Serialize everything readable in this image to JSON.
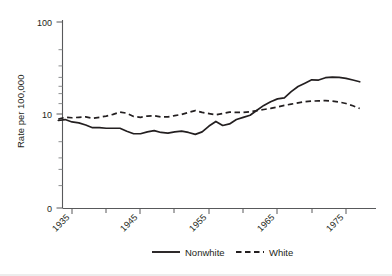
{
  "chart_data": {
    "type": "line",
    "title": "",
    "xlabel": "",
    "ylabel": "Rate per 100,000",
    "yscale": "log",
    "ylim": [
      3,
      100
    ],
    "xlim": [
      1933,
      1978
    ],
    "grid": false,
    "legend_position": "bottom-center",
    "y_tick_labels": [
      "100",
      "10",
      "0"
    ],
    "y_tick_values": [
      100,
      10,
      0
    ],
    "x_tick_labels": [
      "1935",
      "1945",
      "1955",
      "1965",
      "1975"
    ],
    "x_tick_values": [
      1935,
      1945,
      1955,
      1965,
      1975
    ],
    "x_minor_tick_values": [
      1940,
      1950,
      1960,
      1970
    ],
    "series": [
      {
        "name": "Nonwhite",
        "style": "solid",
        "color": "#231f20",
        "x": [
          1933,
          1934,
          1935,
          1936,
          1937,
          1938,
          1939,
          1940,
          1941,
          1942,
          1943,
          1944,
          1945,
          1946,
          1947,
          1948,
          1949,
          1950,
          1951,
          1952,
          1953,
          1954,
          1955,
          1956,
          1957,
          1958,
          1959,
          1960,
          1961,
          1962,
          1963,
          1964,
          1965,
          1966,
          1967,
          1968,
          1969,
          1970,
          1971,
          1972,
          1973,
          1974,
          1975,
          1976,
          1977
        ],
        "values": [
          8.5,
          8.7,
          8.2,
          8.0,
          7.6,
          7.1,
          7.1,
          7.0,
          7.0,
          7.0,
          6.5,
          6.1,
          6.1,
          6.4,
          6.6,
          6.3,
          6.2,
          6.4,
          6.5,
          6.3,
          6.0,
          6.4,
          7.4,
          8.3,
          7.5,
          7.8,
          8.7,
          9.2,
          9.7,
          11.0,
          12.4,
          13.6,
          14.6,
          15.0,
          17.5,
          19.9,
          21.6,
          23.5,
          23.4,
          24.8,
          25.2,
          25.0,
          24.4,
          23.4,
          22.4
        ]
      },
      {
        "name": "White",
        "style": "dashed",
        "color": "#231f20",
        "x": [
          1933,
          1934,
          1935,
          1936,
          1937,
          1938,
          1939,
          1940,
          1941,
          1942,
          1943,
          1944,
          1945,
          1946,
          1947,
          1948,
          1949,
          1950,
          1951,
          1952,
          1953,
          1954,
          1955,
          1956,
          1957,
          1958,
          1959,
          1960,
          1961,
          1962,
          1963,
          1964,
          1965,
          1966,
          1967,
          1968,
          1969,
          1970,
          1971,
          1972,
          1973,
          1974,
          1975,
          1976,
          1977
        ],
        "values": [
          8.8,
          9.2,
          9.1,
          9.2,
          9.3,
          9.0,
          9.2,
          9.5,
          9.9,
          10.5,
          10.2,
          9.4,
          9.2,
          9.5,
          9.6,
          9.3,
          9.3,
          9.6,
          9.9,
          10.4,
          10.9,
          10.4,
          10.1,
          9.8,
          10.1,
          10.5,
          10.4,
          10.4,
          10.6,
          10.9,
          11.2,
          11.5,
          11.9,
          12.4,
          12.8,
          13.2,
          13.6,
          13.8,
          13.9,
          14.0,
          13.8,
          13.5,
          13.0,
          12.3,
          11.5
        ]
      }
    ]
  },
  "legend": {
    "entries": [
      {
        "label": "Nonwhite",
        "style": "solid"
      },
      {
        "label": "White",
        "style": "dashed"
      }
    ]
  }
}
